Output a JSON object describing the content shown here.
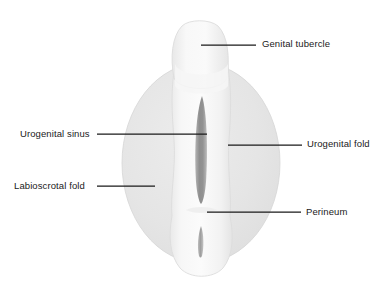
{
  "figure": {
    "type": "anatomical-diagram",
    "background_color": "#ffffff",
    "line_color": "#1a1a1a",
    "labioscrotal_fill": "#e6e6e6",
    "phallus_fill": "#f4f4f4",
    "slit_fill": "#9a9a9a"
  },
  "labels": [
    {
      "id": "genital-tubercle",
      "text": "Genital tubercle",
      "side": "right",
      "text_x": 262,
      "text_y": 38,
      "leader": {
        "x1": 201,
        "y1": 45,
        "x2": 256,
        "y2": 45
      }
    },
    {
      "id": "urogenital-sinus",
      "text": "Urogenital sinus",
      "side": "left",
      "text_x": 20,
      "text_y": 128,
      "leader": {
        "x1": 97,
        "y1": 134,
        "x2": 207,
        "y2": 134
      }
    },
    {
      "id": "urogenital-fold",
      "text": "Urogenital fold",
      "side": "right",
      "text_x": 307,
      "text_y": 138,
      "leader": {
        "x1": 228,
        "y1": 145,
        "x2": 302,
        "y2": 145
      }
    },
    {
      "id": "labioscrotal-fold",
      "text": "Labioscrotal fold",
      "side": "left",
      "text_x": 14,
      "text_y": 180,
      "leader": {
        "x1": 97,
        "y1": 186,
        "x2": 155,
        "y2": 186
      }
    },
    {
      "id": "perineum",
      "text": "Perineum",
      "side": "right",
      "text_x": 306,
      "text_y": 206,
      "leader": {
        "x1": 207,
        "y1": 212,
        "x2": 301,
        "y2": 212
      }
    }
  ],
  "structures": [
    {
      "id": "labioscrotal-swelling",
      "name": "Labioscrotal swelling (oval)"
    },
    {
      "id": "genital-tubercle-shape",
      "name": "Genital tubercle"
    },
    {
      "id": "phallic-shaft",
      "name": "Phallic shaft / urogenital folds"
    },
    {
      "id": "urogenital-sinus-slit",
      "name": "Urogenital sinus opening"
    },
    {
      "id": "anal-opening",
      "name": "Anal opening"
    },
    {
      "id": "perineal-body",
      "name": "Perineum"
    }
  ]
}
